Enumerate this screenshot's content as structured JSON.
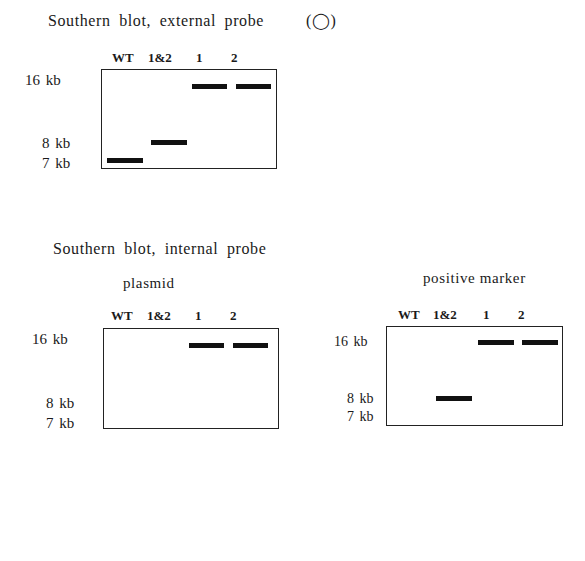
{
  "blot_external": {
    "title": "Southern blot, external probe",
    "symbol": "(◯)",
    "lanes": [
      "WT",
      "1&2",
      "1",
      "2"
    ],
    "sizes": [
      "16 kb",
      "8 kb",
      "7 kb"
    ],
    "bands": [
      {
        "lane": "WT",
        "size": "7 kb"
      },
      {
        "lane": "1&2",
        "size": "8 kb"
      },
      {
        "lane": "1",
        "size": "16 kb"
      },
      {
        "lane": "2",
        "size": "16 kb"
      }
    ]
  },
  "internal_title": "Southern blot, internal probe",
  "blot_plasmid": {
    "title": "plasmid",
    "lanes": [
      "WT",
      "1&2",
      "1",
      "2"
    ],
    "sizes": [
      "16 kb",
      "8 kb",
      "7 kb"
    ],
    "bands": [
      {
        "lane": "1",
        "size": "16 kb"
      },
      {
        "lane": "2",
        "size": "16 kb"
      }
    ]
  },
  "blot_marker": {
    "title": "positive marker",
    "lanes": [
      "WT",
      "1&2",
      "1",
      "2"
    ],
    "sizes": [
      "16 kb",
      "8 kb",
      "7 kb"
    ],
    "bands": [
      {
        "lane": "1&2",
        "size": "8 kb"
      },
      {
        "lane": "1",
        "size": "16 kb"
      },
      {
        "lane": "2",
        "size": "16 kb"
      }
    ]
  }
}
